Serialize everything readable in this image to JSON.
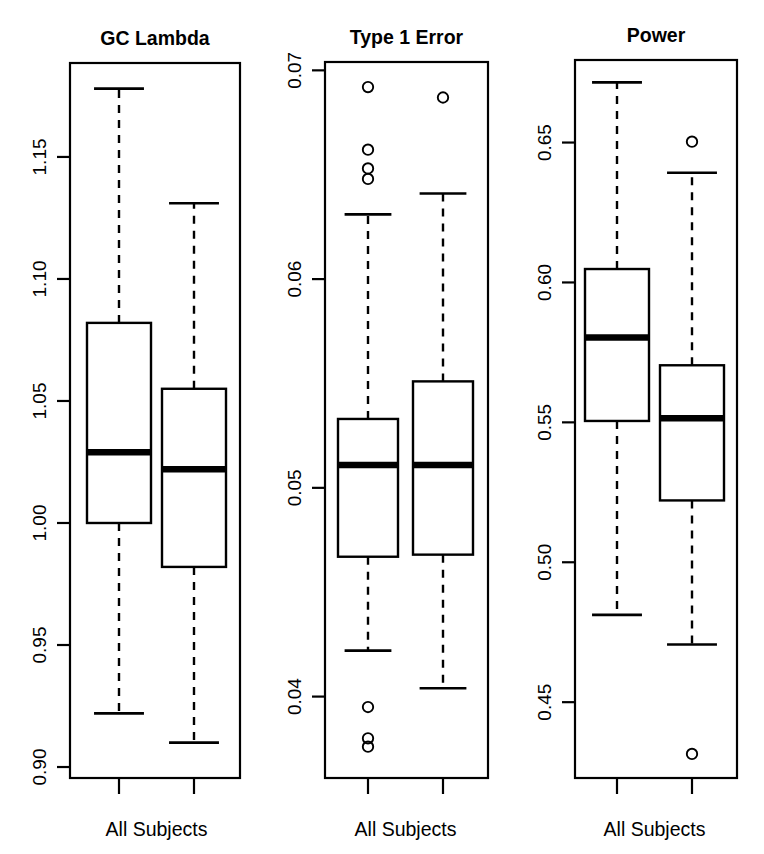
{
  "figure": {
    "width": 764,
    "height": 854,
    "background": "#ffffff",
    "foreground": "#000000",
    "panel_count": 3
  },
  "chart_data": [
    {
      "type": "boxplot",
      "title": "GC Lambda",
      "xlabel": "All Subjects",
      "ylabel": "",
      "grid": false,
      "legend": false,
      "ylim": [
        0.8955,
        1.1885
      ],
      "ytick_labels": [
        "1.15",
        "1.10",
        "1.05",
        "1.00",
        "0.95",
        "0.90"
      ],
      "ytick_values": [
        1.15,
        1.1,
        1.05,
        1.0,
        0.95,
        0.9
      ],
      "xtick_labels": [
        "",
        ""
      ],
      "boxes": [
        {
          "name": "box-1",
          "whisker_high": 1.178,
          "q3": 1.082,
          "median": 1.029,
          "q1": 1.0,
          "whisker_low": 0.922,
          "outliers": []
        },
        {
          "name": "box-2",
          "whisker_high": 1.131,
          "q3": 1.055,
          "median": 1.022,
          "q1": 0.982,
          "whisker_low": 0.91,
          "outliers": []
        }
      ]
    },
    {
      "type": "boxplot",
      "title": "Type 1 Error",
      "xlabel": "All Subjects",
      "ylabel": "",
      "grid": false,
      "legend": false,
      "ylim": [
        0.0361,
        0.0704
      ],
      "ytick_labels": [
        "0.07",
        "0.06",
        "0.05",
        "0.04"
      ],
      "ytick_values": [
        0.07,
        0.06,
        0.05,
        0.04
      ],
      "xtick_labels": [
        "",
        ""
      ],
      "boxes": [
        {
          "name": "box-1",
          "whisker_high": 0.0631,
          "q3": 0.0533,
          "median": 0.0511,
          "q1": 0.0467,
          "whisker_low": 0.0422,
          "outliers": [
            0.0692,
            0.0662,
            0.0653,
            0.0648,
            0.0395,
            0.038,
            0.0376
          ]
        },
        {
          "name": "box-2",
          "whisker_high": 0.0641,
          "q3": 0.0551,
          "median": 0.0511,
          "q1": 0.0468,
          "whisker_low": 0.0404,
          "outliers": [
            0.0687
          ]
        }
      ]
    },
    {
      "type": "boxplot",
      "title": "Power",
      "xlabel": "All Subjects",
      "ylabel": "",
      "grid": false,
      "legend": false,
      "ylim": [
        0.4229,
        0.6795
      ],
      "ytick_labels": [
        "0.65",
        "0.60",
        "0.55",
        "0.50",
        "0.45"
      ],
      "ytick_values": [
        0.65,
        0.6,
        0.55,
        0.5,
        0.45
      ],
      "xtick_labels": [
        "",
        ""
      ],
      "boxes": [
        {
          "name": "box-1",
          "whisker_high": 0.6715,
          "q3": 0.6048,
          "median": 0.5803,
          "q1": 0.5505,
          "whisker_low": 0.4812,
          "outliers": []
        },
        {
          "name": "box-2",
          "whisker_high": 0.6392,
          "q3": 0.5704,
          "median": 0.5515,
          "q1": 0.5221,
          "whisker_low": 0.4706,
          "outliers": [
            0.6503,
            0.4315
          ]
        }
      ]
    }
  ],
  "panels": [
    {
      "id": "gc-lambda",
      "title": "GC Lambda",
      "xlabel": "All Subjects",
      "left": 0,
      "width": 258,
      "plot": {
        "x0": 70,
        "x1": 240,
        "y0": 63,
        "y1": 778
      },
      "ylim": [
        0.8955,
        1.1885
      ],
      "ticks": [
        {
          "label": "1.15",
          "value": 1.15
        },
        {
          "label": "1.10",
          "value": 1.1
        },
        {
          "label": "1.05",
          "value": 1.05
        },
        {
          "label": "1.00",
          "value": 1.0
        },
        {
          "label": "0.95",
          "value": 0.95
        },
        {
          "label": "0.90",
          "value": 0.9
        }
      ],
      "box_centers": [
        119,
        194
      ],
      "box_half_width": 32,
      "boxes": [
        {
          "whisker_high": 1.178,
          "q3": 1.082,
          "median": 1.029,
          "q1": 1.0,
          "whisker_low": 0.922,
          "outliers": []
        },
        {
          "whisker_high": 1.131,
          "q3": 1.055,
          "median": 1.022,
          "q1": 0.982,
          "whisker_low": 0.91,
          "outliers": []
        }
      ]
    },
    {
      "id": "type-1-error",
      "title": "Type 1 Error",
      "xlabel": "All Subjects",
      "left": 255,
      "width": 255,
      "plot": {
        "x0": 70,
        "x1": 233,
        "y0": 62,
        "y1": 778
      },
      "ylim": [
        0.0361,
        0.0704
      ],
      "ticks": [
        {
          "label": "0.07",
          "value": 0.07
        },
        {
          "label": "0.06",
          "value": 0.06
        },
        {
          "label": "0.05",
          "value": 0.05
        },
        {
          "label": "0.04",
          "value": 0.04
        }
      ],
      "box_centers": [
        113,
        188
      ],
      "box_half_width": 30,
      "boxes": [
        {
          "whisker_high": 0.0631,
          "q3": 0.0533,
          "median": 0.0511,
          "q1": 0.0467,
          "whisker_low": 0.0422,
          "outliers": [
            0.0692,
            0.0662,
            0.0653,
            0.0648,
            0.0395,
            0.038,
            0.0376
          ]
        },
        {
          "whisker_high": 0.0641,
          "q3": 0.0551,
          "median": 0.0511,
          "q1": 0.0468,
          "whisker_low": 0.0404,
          "outliers": [
            0.0687
          ]
        }
      ]
    },
    {
      "id": "power",
      "title": "Power",
      "xlabel": "All Subjects",
      "left": 505,
      "width": 259,
      "plot": {
        "x0": 70,
        "x1": 232,
        "y0": 60,
        "y1": 778
      },
      "ylim": [
        0.4229,
        0.6795
      ],
      "ticks": [
        {
          "label": "0.65",
          "value": 0.65
        },
        {
          "label": "0.60",
          "value": 0.6
        },
        {
          "label": "0.55",
          "value": 0.55
        },
        {
          "label": "0.50",
          "value": 0.5
        },
        {
          "label": "0.45",
          "value": 0.45
        }
      ],
      "box_centers": [
        112,
        187
      ],
      "box_half_width": 32,
      "boxes": [
        {
          "whisker_high": 0.6715,
          "q3": 0.6048,
          "median": 0.5803,
          "q1": 0.5505,
          "whisker_low": 0.4812,
          "outliers": []
        },
        {
          "whisker_high": 0.6392,
          "q3": 0.5704,
          "median": 0.5515,
          "q1": 0.5221,
          "whisker_low": 0.4706,
          "outliers": [
            0.6503,
            0.4315
          ]
        }
      ]
    }
  ]
}
